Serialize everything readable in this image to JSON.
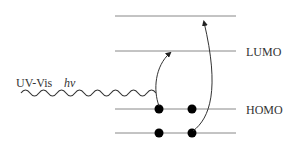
{
  "diagram": {
    "levels": [
      {
        "id": "top",
        "label": ""
      },
      {
        "id": "lumo",
        "label": "LUMO"
      },
      {
        "id": "homo",
        "label": "HOMO"
      },
      {
        "id": "bottom",
        "label": ""
      }
    ],
    "light": {
      "source_label": "UV-Vis",
      "photon_label": "hν"
    },
    "electrons": {
      "homo_count": 2,
      "bottom_count": 2
    },
    "transitions": [
      {
        "from": "homo",
        "to": "lumo"
      },
      {
        "from": "bottom",
        "to": "top"
      }
    ],
    "colors": {
      "line": "#888888",
      "arrow": "#333333",
      "electron": "#000000",
      "text": "#333333"
    }
  }
}
